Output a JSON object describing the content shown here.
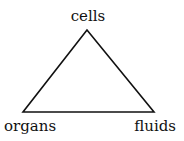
{
  "diagram": {
    "type": "triangle",
    "nodes": [
      {
        "id": "cells",
        "label": "cells",
        "position": "top"
      },
      {
        "id": "organs",
        "label": "organs",
        "position": "bottom-left"
      },
      {
        "id": "fluids",
        "label": "fluids",
        "position": "bottom-right"
      }
    ],
    "edges": [
      {
        "from": "cells",
        "to": "organs"
      },
      {
        "from": "cells",
        "to": "fluids"
      },
      {
        "from": "organs",
        "to": "fluids"
      }
    ],
    "colors": {
      "line": "#111111",
      "text": "#111111",
      "background": "#ffffff"
    }
  }
}
